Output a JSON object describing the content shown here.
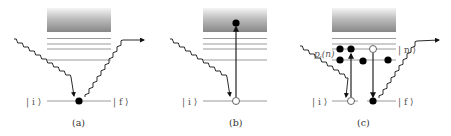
{
  "figure": {
    "colors": {
      "level_line": "#9a9a9a",
      "gradient_top": "#f2f2f2",
      "gradient_bottom": "#8a8a8a",
      "wave": "#2a2a2a",
      "arrow": "#222222",
      "dot_filled": "#000000",
      "dot_open_fill": "#ffffff",
      "dot_open_stroke": "#555555",
      "text": "#555555"
    },
    "panels": [
      {
        "id": "a",
        "caption": "(a)",
        "initial_state_label": "| i ⟩",
        "final_state_label": "| f ⟩",
        "description": "Elastic/Rayleigh scattering: incoming photon absorbed and emitted at ground state"
      },
      {
        "id": "b",
        "caption": "(b)",
        "initial_state_label": "| i ⟩",
        "description": "Photoionization: photon excites electron from initial state to continuum"
      },
      {
        "id": "c",
        "caption": "(c)",
        "initial_state_label": "| i ⟩",
        "final_state_label": "| f ⟩",
        "intermediate_state_label": "| n ⟩",
        "occupation_label": "p",
        "occupation_sub": "i",
        "occupation_arg": "(n)",
        "description": "Raman scattering via intermediate state n"
      }
    ]
  }
}
